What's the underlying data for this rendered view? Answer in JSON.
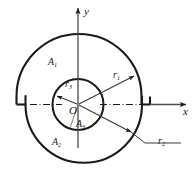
{
  "figure": {
    "background_color": "#ffffff",
    "line_color": "#1a1a1a",
    "axes": {
      "x_label": "x",
      "y_label": "y",
      "origin_label": "O"
    },
    "regions": [
      {
        "key": "A1",
        "label": "A",
        "subscript": "1",
        "description": "upper large sector"
      },
      {
        "key": "A2",
        "label": "A",
        "subscript": "2",
        "description": "lower large semicircle"
      },
      {
        "key": "A3",
        "label": "A",
        "subscript": "3",
        "description": "inner circle"
      }
    ],
    "radii": [
      {
        "key": "r1",
        "label": "r",
        "subscript": "1",
        "description": "upper sector outer radius"
      },
      {
        "key": "r2",
        "label": "r",
        "subscript": "2",
        "description": "lower semicircle radius"
      },
      {
        "key": "r3",
        "label": "r",
        "subscript": "3",
        "description": "inner circle radius"
      }
    ],
    "labels": {
      "y": "y",
      "x": "x",
      "O": "O",
      "A1": "A",
      "A1_sub": "1",
      "A2": "A",
      "A2_sub": "2",
      "A3": "A",
      "A3_sub": "3",
      "r1": "r",
      "r1_sub": "1",
      "r2": "r",
      "r2_sub": "2",
      "r3": "r",
      "r3_sub": "3"
    }
  }
}
